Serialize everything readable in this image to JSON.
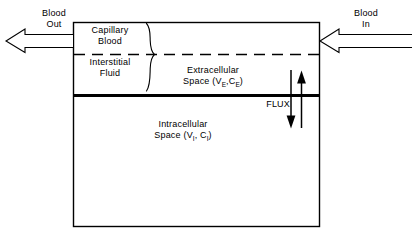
{
  "diagram": {
    "type": "compartment-diagram",
    "colors": {
      "line": "#000000",
      "background": "#ffffff",
      "text": "#000000"
    },
    "labels": {
      "blood_out_line1": "Blood",
      "blood_out_line2": "Out",
      "blood_in_line1": "Blood",
      "blood_in_line2": "In",
      "capillary_blood_line1": "Capillary",
      "capillary_blood_line2": "Blood",
      "interstitial_fluid_line1": "Interstitial",
      "interstitial_fluid_line2": "Fluid",
      "extracellular_line1": "Extracellular",
      "extracellular_space_prefix": "Space (V",
      "extracellular_sub_1": "E",
      "extracellular_mid": ",C",
      "extracellular_sub_2": "E",
      "extracellular_suffix": ")",
      "intracellular_line1": "Intracellular",
      "intracellular_space_prefix": "Space (V",
      "intracellular_sub_1": "I",
      "intracellular_mid": ", C",
      "intracellular_sub_2": "I",
      "intracellular_suffix": ")",
      "flux": "FLUX"
    },
    "icons": {
      "blood_out_arrow": "arrow-left-outline-icon",
      "blood_in_arrow": "arrow-left-outline-icon",
      "flux_down_arrow": "arrow-down-icon",
      "flux_up_arrow": "arrow-up-icon",
      "compartment_brace": "curly-brace-icon"
    }
  }
}
